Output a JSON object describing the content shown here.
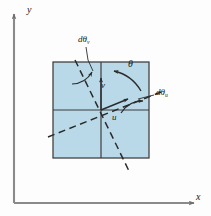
{
  "figure": {
    "axes": {
      "x_label": "x",
      "y_label": "y"
    },
    "labels": {
      "theta": "θ",
      "u_axis": "u",
      "v_axis": "v",
      "d_theta_v_prefix": "dθ",
      "d_theta_v_sub": "v",
      "d_theta_u_prefix": "dθ",
      "d_theta_u_sub": "u"
    },
    "colors": {
      "element_fill": "#b9d9e8",
      "element_stroke": "#3c3c3c",
      "axis_stroke": "#8a8a8a",
      "dashed_stroke": "#2b2b2b",
      "text": "#1a1a1a",
      "background": "#fdfdfd"
    },
    "geometry": {
      "square_left": 53,
      "square_top": 62,
      "square_size": 96,
      "center_x": 101,
      "center_y": 110,
      "theta_degrees": 30
    }
  }
}
